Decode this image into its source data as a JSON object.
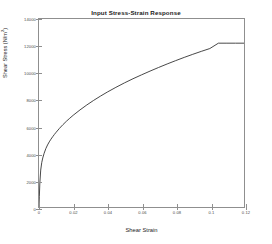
{
  "chart_data": {
    "type": "line",
    "title": "Input Stress-Strain Response",
    "xlabel": "Shear Strain",
    "ylabel_text": "Shear Stress (N/m",
    "ylabel_sup": "2",
    "ylabel_tail": ")",
    "ylabel_full": "Shear Stress (N/m2)",
    "xlim": [
      0,
      0.12
    ],
    "ylim": [
      0,
      14000
    ],
    "grid": false,
    "legend": null,
    "line_color": "#333333",
    "axis_color": "#8f8f8f",
    "xticks": [
      0,
      0.02,
      0.04,
      0.06,
      0.08,
      0.1,
      0.12
    ],
    "xtick_labels": [
      "0",
      "0.02",
      "0.04",
      "0.06",
      "0.08",
      "0.1",
      "0.12"
    ],
    "yticks": [
      0,
      2000,
      4000,
      6000,
      8000,
      10000,
      12000,
      14000
    ],
    "ytick_labels": [
      "0",
      "2000",
      "4000",
      "6000",
      "8000",
      "10000",
      "12000",
      "14000"
    ],
    "series": [
      {
        "name": "Shear stress response",
        "x": [
          0,
          0.0002,
          0.0005,
          0.001,
          0.0016,
          0.0022,
          0.003,
          0.004,
          0.005,
          0.006,
          0.007,
          0.008,
          0.009,
          0.01,
          0.012,
          0.014,
          0.016,
          0.018,
          0.02,
          0.024,
          0.028,
          0.032,
          0.036,
          0.04,
          0.045,
          0.05,
          0.055,
          0.06,
          0.065,
          0.07,
          0.075,
          0.08,
          0.085,
          0.09,
          0.095,
          0.1,
          0.105,
          0.11,
          0.115,
          0.12
        ],
        "y": [
          0,
          800,
          1800,
          2750,
          3300,
          3650,
          4000,
          4350,
          4620,
          4850,
          5050,
          5230,
          5400,
          5560,
          5860,
          6130,
          6380,
          6610,
          6830,
          7230,
          7600,
          7940,
          8260,
          8560,
          8910,
          9240,
          9550,
          9840,
          10120,
          10390,
          10650,
          10900,
          11140,
          11370,
          11590,
          11800,
          12200,
          12200,
          12200,
          12200
        ]
      }
    ],
    "annotations": [
      {
        "text": "plateau onset",
        "x": 0.105,
        "y": 12200
      }
    ]
  }
}
